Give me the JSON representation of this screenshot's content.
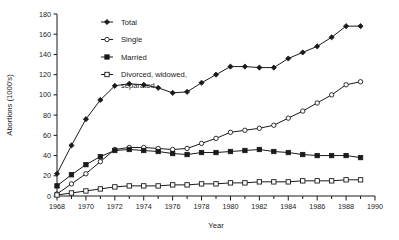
{
  "chart_data": {
    "type": "line",
    "title": "",
    "xlabel": "Year",
    "ylabel": "Abortions (1000's)",
    "xlim": [
      1968,
      1990
    ],
    "ylim": [
      0,
      180
    ],
    "ytick_step": 20,
    "xtick_step": 2,
    "xminor_step": 1,
    "grid": false,
    "legend_position": "top-left-inside",
    "yticks": [
      "0",
      "20",
      "40",
      "60",
      "80",
      "100",
      "120",
      "140",
      "160",
      "180"
    ],
    "xticks": [
      "1968",
      "1970",
      "1972",
      "1974",
      "1976",
      "1978",
      "1980",
      "1982",
      "1984",
      "1986",
      "1988",
      "1990"
    ],
    "x": [
      1968,
      1969,
      1970,
      1971,
      1972,
      1973,
      1974,
      1975,
      1976,
      1977,
      1978,
      1979,
      1980,
      1981,
      1982,
      1983,
      1984,
      1985,
      1986,
      1987,
      1988,
      1989
    ],
    "series": [
      {
        "name": "Total",
        "marker": "filled-diamond",
        "color": "#1a1a1a",
        "values": [
          22,
          50,
          76,
          95,
          109,
          111,
          110,
          107,
          102,
          103,
          112,
          120,
          128,
          128,
          127,
          127,
          136,
          142,
          148,
          157,
          168,
          168
        ]
      },
      {
        "name": "Single",
        "marker": "open-circle",
        "color": "#1a1a1a",
        "values": [
          2,
          12,
          22,
          34,
          46,
          48,
          48,
          47,
          46,
          47,
          52,
          57,
          63,
          65,
          67,
          70,
          77,
          84,
          92,
          100,
          110,
          113
        ]
      },
      {
        "name": "Married",
        "marker": "filled-square",
        "color": "#1a1a1a",
        "values": [
          10,
          21,
          31,
          39,
          45,
          46,
          45,
          44,
          42,
          41,
          43,
          43,
          44,
          45,
          46,
          44,
          43,
          41,
          40,
          40,
          40,
          38
        ]
      },
      {
        "name": "Divorced, widowed, separated",
        "marker": "open-square",
        "color": "#1a1a1a",
        "values": [
          1,
          3,
          5,
          7,
          9,
          10,
          10,
          10,
          11,
          11,
          12,
          12,
          13,
          13,
          14,
          14,
          14,
          15,
          15,
          15,
          16,
          16
        ]
      }
    ]
  },
  "legend": {
    "items": [
      {
        "label": "Total",
        "marker": "filled-diamond"
      },
      {
        "label": "Single",
        "marker": "open-circle"
      },
      {
        "label": "Married",
        "marker": "filled-square"
      },
      {
        "label": "Divorced, widowed,",
        "label2": "separated",
        "marker": "open-square"
      }
    ]
  },
  "colors": {
    "ink": "#1a1a1a",
    "background": "#ffffff"
  }
}
